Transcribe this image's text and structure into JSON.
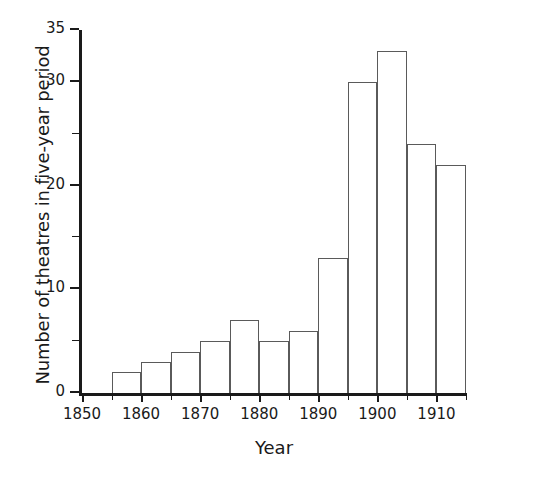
{
  "chart_data": {
    "type": "bar",
    "title": "",
    "subtitle": "",
    "xlabel": "Year",
    "ylabel": "Number of theatres in five-year period",
    "categories": [
      "1855-1860",
      "1860-1865",
      "1865-1870",
      "1870-1875",
      "1875-1880",
      "1880-1885",
      "1885-1890",
      "1890-1895",
      "1895-1900",
      "1900-1905",
      "1905-1910",
      "1910-1915"
    ],
    "bin_starts": [
      1855,
      1860,
      1865,
      1870,
      1875,
      1880,
      1885,
      1890,
      1895,
      1900,
      1905,
      1910
    ],
    "bin_width": 5,
    "values": [
      2,
      3,
      4,
      5,
      7,
      5,
      6,
      13,
      30,
      33,
      24,
      22
    ],
    "xlim": [
      1850,
      1915
    ],
    "ylim": [
      0,
      35
    ],
    "ytick_labels": [
      "0",
      "10",
      "20",
      "30",
      "35"
    ],
    "ytick_values": [
      0,
      10,
      20,
      30,
      35
    ],
    "yminor_ticks": [
      5,
      15,
      25
    ],
    "xtick_labels": [
      "1850",
      "1860",
      "1870",
      "1880",
      "1890",
      "1900",
      "1910"
    ],
    "xtick_values": [
      1850,
      1860,
      1870,
      1880,
      1890,
      1900,
      1910
    ],
    "xminor_ticks": [
      1855,
      1865,
      1875,
      1885,
      1895,
      1905,
      1915
    ],
    "grid": false,
    "legend": null,
    "bar_face_color": "#ffffff",
    "bar_edge_color": "#5a5a5a",
    "axis_color": "#1a1a1a"
  }
}
